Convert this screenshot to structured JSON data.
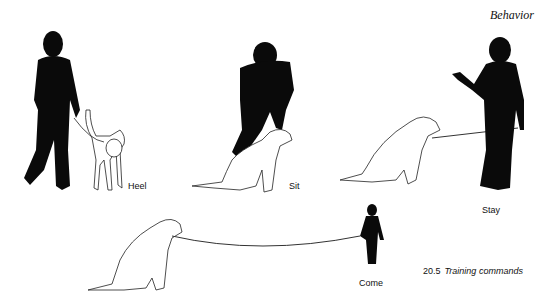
{
  "page": {
    "running_header": "Behavior"
  },
  "figure": {
    "number": "20.5",
    "caption": "Training commands",
    "panels": [
      {
        "label": "Heel",
        "description": "person walking with dog on leash at heel"
      },
      {
        "label": "Sit",
        "description": "person bending over dog in sitting position"
      },
      {
        "label": "Stay",
        "description": "person with raised hand, dog sitting on leash"
      },
      {
        "label": "Come",
        "description": "distant person calling dog on long leash"
      }
    ]
  }
}
